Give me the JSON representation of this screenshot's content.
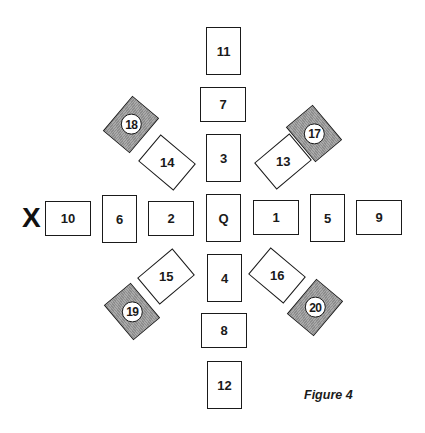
{
  "figure": {
    "caption": "Figure 4",
    "marker": "X",
    "colors": {
      "border": "#1a1a1a",
      "card_fill": "#ffffff",
      "shaded_fill": "#9b9b9b"
    }
  },
  "cards": {
    "c11": {
      "label": "11",
      "orientation": "portrait"
    },
    "c7": {
      "label": "7",
      "orientation": "landscape"
    },
    "c3": {
      "label": "3",
      "orientation": "portrait"
    },
    "cQ": {
      "label": "Q",
      "orientation": "portrait"
    },
    "c4": {
      "label": "4",
      "orientation": "portrait"
    },
    "c8": {
      "label": "8",
      "orientation": "landscape"
    },
    "c12": {
      "label": "12",
      "orientation": "portrait"
    },
    "c10": {
      "label": "10",
      "orientation": "landscape"
    },
    "c6": {
      "label": "6",
      "orientation": "portrait"
    },
    "c2": {
      "label": "2",
      "orientation": "landscape"
    },
    "c1": {
      "label": "1",
      "orientation": "landscape"
    },
    "c5": {
      "label": "5",
      "orientation": "portrait"
    },
    "c9": {
      "label": "9",
      "orientation": "landscape"
    },
    "c14": {
      "label": "14",
      "orientation": "diagonal"
    },
    "c13": {
      "label": "13",
      "orientation": "diagonal"
    },
    "c15": {
      "label": "15",
      "orientation": "diagonal"
    },
    "c16": {
      "label": "16",
      "orientation": "diagonal"
    },
    "c18": {
      "label": "18",
      "orientation": "diagonal",
      "shaded": true,
      "circled": true
    },
    "c17": {
      "label": "17",
      "orientation": "diagonal",
      "shaded": true,
      "circled": true
    },
    "c19": {
      "label": "19",
      "orientation": "diagonal",
      "shaded": true,
      "circled": true
    },
    "c20": {
      "label": "20",
      "orientation": "diagonal",
      "shaded": true,
      "circled": true
    }
  }
}
